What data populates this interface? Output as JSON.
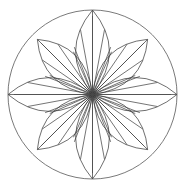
{
  "figure": {
    "type": "line-drawing",
    "background_color": "#ffffff",
    "canvas": {
      "width": 185,
      "height": 190
    }
  },
  "chart_data": {
    "type": "scatter",
    "xlabel": "",
    "ylabel": "",
    "grid": false,
    "legend": null,
    "center": {
      "x": 92.5,
      "y": 94.5
    },
    "outer_circle": {
      "name": "outer-circle",
      "cx": 92.5,
      "cy": 94.5,
      "r": 84.5,
      "stroke": "#6b6b6b",
      "stroke_width": 0.9,
      "fill": "none"
    },
    "petals": {
      "count": 8,
      "angles_deg": [
        0,
        45,
        90,
        135,
        180,
        225,
        270,
        315
      ],
      "tip_radius_axis": 84.5,
      "tip_radius_diagonal": 78.0,
      "half_width_ratio": 0.4,
      "stroke": "#555555",
      "stroke_width": 0.85,
      "fill": "none",
      "labels": [
        "petal-east",
        "petal-northeast",
        "petal-north",
        "petal-northwest",
        "petal-west",
        "petal-southwest",
        "petal-south",
        "petal-southeast"
      ]
    },
    "veins": {
      "per_petal": 5,
      "spread_deg": 21,
      "length_ratios": [
        0.6,
        0.78,
        0.93,
        0.78,
        0.6
      ],
      "stroke": "#3a3a3a",
      "stroke_width": 0.7
    },
    "axis_spokes": {
      "count": 8,
      "stroke": "#4a4a4a",
      "stroke_width": 0.8
    },
    "colors": {
      "ink_dark": "#2e2e2e",
      "ink_mid": "#555555",
      "ink_light": "#6b6b6b",
      "paper": "#ffffff"
    }
  }
}
